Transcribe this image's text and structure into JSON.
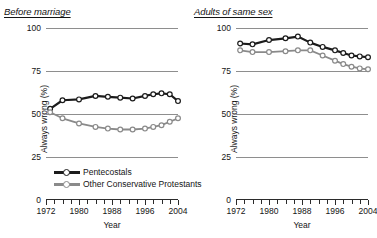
{
  "chart_data": {
    "type": "line",
    "title": "",
    "xlabel": "Year",
    "ylabel": "Always wrong (%)",
    "ylim": [
      0,
      100
    ],
    "xlim": [
      1972,
      2004
    ],
    "yticks": [
      0,
      25,
      50,
      75,
      100
    ],
    "xticks": [
      1972,
      1980,
      1988,
      1996,
      2004
    ],
    "xtick_labels": [
      "1972",
      "1980",
      "1988",
      "1996",
      "2004"
    ],
    "ytick_labels": [
      "0",
      "25",
      "50",
      "75",
      "100"
    ],
    "grid": "horizontal",
    "legend_position": "bottom-left",
    "legend_entries": [
      "Pentecostals",
      "Other Conservative Protestants"
    ],
    "panels": [
      {
        "title": "Before marriage",
        "series": [
          {
            "name": "Pentecostals",
            "color": "#1c1c1c",
            "x": [
              1973,
              1976,
              1980,
              1984,
              1987,
              1990,
              1993,
              1996,
              1998,
              2000,
              2002,
              2004
            ],
            "values": [
              53,
              58,
              58.5,
              60.5,
              60,
              59.5,
              59,
              60.5,
              61.5,
              62,
              61.5,
              57.5
            ]
          },
          {
            "name": "Other Conservative Protestants",
            "color": "#8a8a8a",
            "x": [
              1973,
              1976,
              1980,
              1984,
              1987,
              1990,
              1993,
              1996,
              1998,
              2000,
              2002,
              2004
            ],
            "values": [
              51,
              47.5,
              44.5,
              42.5,
              41.5,
              41,
              41,
              41.5,
              42.5,
              43.5,
              45.5,
              47.5
            ]
          }
        ]
      },
      {
        "title": "Adults of same sex",
        "series": [
          {
            "name": "Pentecostals",
            "color": "#1c1c1c",
            "x": [
              1973,
              1976,
              1980,
              1984,
              1987,
              1990,
              1993,
              1996,
              1998,
              2000,
              2002,
              2004
            ],
            "values": [
              91,
              90.5,
              93,
              94,
              95,
              91.5,
              89,
              87,
              85.5,
              84,
              83.5,
              83
            ]
          },
          {
            "name": "Other Conservative Protestants",
            "color": "#8a8a8a",
            "x": [
              1973,
              1976,
              1980,
              1984,
              1987,
              1990,
              1993,
              1996,
              1998,
              2000,
              2002,
              2004
            ],
            "values": [
              87,
              86,
              86,
              86.5,
              87,
              87,
              84,
              81,
              79,
              77.5,
              76.5,
              76
            ]
          }
        ]
      }
    ]
  },
  "colors": {
    "series_1": "#1c1c1c",
    "series_2": "#8a8a8a",
    "gridline": "#8e8e8e",
    "axis": "#2b2b2b",
    "background": "#ffffff"
  }
}
